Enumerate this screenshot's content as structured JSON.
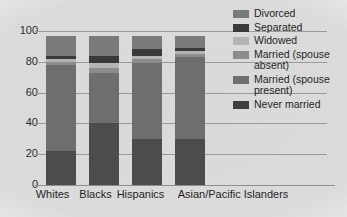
{
  "chart_data": {
    "type": "bar",
    "title": "",
    "subtitle": "",
    "xlabel": "",
    "ylabel": "",
    "stacked": true,
    "orientation": "vertical",
    "grid": true,
    "grid_axis": "y",
    "legend_position": "right",
    "ylim": [
      0,
      100
    ],
    "yticks": [
      "0",
      "20",
      "40",
      "60",
      "80",
      "100"
    ],
    "ytick_values": [
      0,
      20,
      40,
      60,
      80,
      100
    ],
    "categories": [
      "Whites",
      "Blacks",
      "Hispanics",
      "Asian/Pacific Islanders"
    ],
    "series": [
      {
        "name": "Never married",
        "color": "#4c4c4c",
        "values": [
          22,
          40,
          30,
          30
        ]
      },
      {
        "name": "Married (spouse present)",
        "color": "#6e6e6e",
        "values": [
          56,
          33,
          49,
          53
        ]
      },
      {
        "name": "Married (spouse absent)",
        "color": "#8c8c8c",
        "values": [
          2,
          3,
          3,
          2
        ]
      },
      {
        "name": "Widowed",
        "color": "#b4b4b4",
        "values": [
          2,
          3,
          2,
          2
        ]
      },
      {
        "name": "Separated",
        "color": "#3a3a3a",
        "values": [
          2,
          5,
          4,
          2
        ]
      },
      {
        "name": "Divorced",
        "color": "#7a7a7a",
        "values": [
          13,
          13,
          9,
          8
        ]
      }
    ],
    "legend_entries": [
      "Divorced",
      "Separated",
      "Widowed",
      "Married (spouse\nabsent)",
      "Married (spouse\npresent)",
      "Never married"
    ],
    "legend_colors": [
      "#7a7a7a",
      "#3a3a3a",
      "#b4b4b4",
      "#8c8c8c",
      "#6e6e6e",
      "#3f3f3f"
    ],
    "axis_color": "#9a9a9a",
    "background_color": "#d6d6d6",
    "bar_totals": [
      97,
      97,
      97,
      97
    ]
  }
}
